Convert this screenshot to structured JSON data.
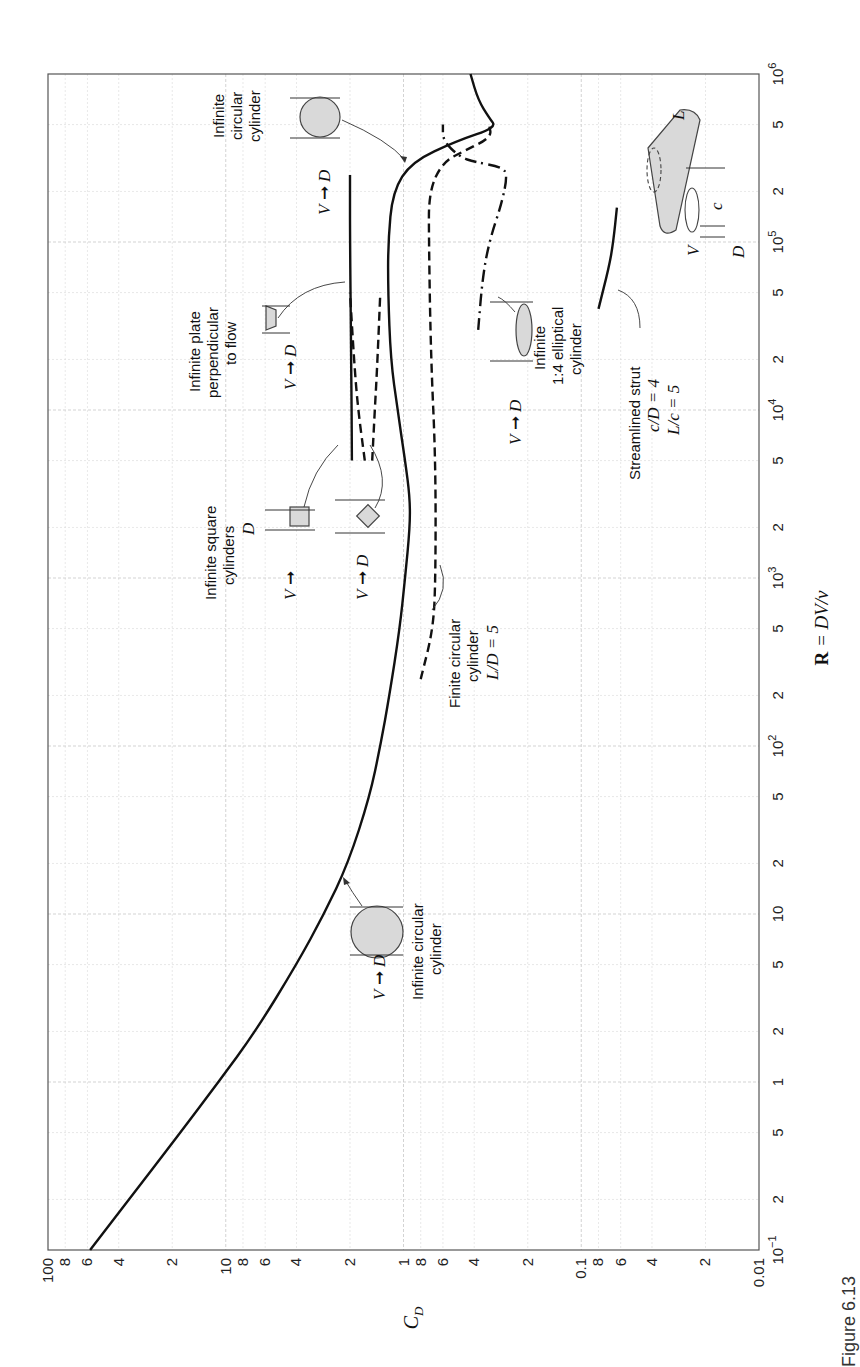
{
  "figure": {
    "caption_fragment": "Figure 6.13",
    "orientation": "rotated 90° counter-clockwise (Reynolds number runs bottom→top along the right edge; C_D runs left→right along the bottom edge)"
  },
  "axes": {
    "cd_label": "C",
    "cd_label_sub": "D",
    "re_label_bold": "R",
    "re_label_rest": " = DV/ν",
    "cd_ticks": [
      {
        "v": 100,
        "t": "100"
      },
      {
        "v": 80,
        "t": "8"
      },
      {
        "v": 60,
        "t": "6"
      },
      {
        "v": 40,
        "t": "4"
      },
      {
        "v": 20,
        "t": "2"
      },
      {
        "v": 10,
        "t": "10"
      },
      {
        "v": 8,
        "t": "8"
      },
      {
        "v": 6,
        "t": "6"
      },
      {
        "v": 4,
        "t": "4"
      },
      {
        "v": 2,
        "t": "2"
      },
      {
        "v": 1,
        "t": "1"
      },
      {
        "v": 0.8,
        "t": "8"
      },
      {
        "v": 0.6,
        "t": "6"
      },
      {
        "v": 0.4,
        "t": "4"
      },
      {
        "v": 0.2,
        "t": "2"
      },
      {
        "v": 0.1,
        "t": "0.1"
      },
      {
        "v": 0.08,
        "t": "8"
      },
      {
        "v": 0.06,
        "t": "6"
      },
      {
        "v": 0.04,
        "t": "4"
      },
      {
        "v": 0.02,
        "t": "2"
      },
      {
        "v": 0.01,
        "t": "0.01"
      }
    ],
    "re_ticks": [
      {
        "v": 0.1,
        "t": "10",
        "sup": "−1"
      },
      {
        "v": 0.2,
        "t": "2"
      },
      {
        "v": 0.5,
        "t": "5"
      },
      {
        "v": 1,
        "t": "1"
      },
      {
        "v": 2,
        "t": "2"
      },
      {
        "v": 5,
        "t": "5"
      },
      {
        "v": 10,
        "t": "10"
      },
      {
        "v": 20,
        "t": "2"
      },
      {
        "v": 50,
        "t": "5"
      },
      {
        "v": 100,
        "t": "10",
        "sup": "2"
      },
      {
        "v": 200,
        "t": "2"
      },
      {
        "v": 500,
        "t": "5"
      },
      {
        "v": 1000,
        "t": "10",
        "sup": "3"
      },
      {
        "v": 2000,
        "t": "2"
      },
      {
        "v": 5000,
        "t": "5"
      },
      {
        "v": 10000,
        "t": "10",
        "sup": "4"
      },
      {
        "v": 20000,
        "t": "2"
      },
      {
        "v": 50000,
        "t": "5"
      },
      {
        "v": 100000,
        "t": "10",
        "sup": "5"
      },
      {
        "v": 200000,
        "t": "2"
      },
      {
        "v": 500000,
        "t": "5"
      },
      {
        "v": 1000000,
        "t": "10",
        "sup": "6"
      }
    ]
  },
  "annotations": {
    "circ_low": {
      "line1": "Infinite circular",
      "line2": "cylinder"
    },
    "square": {
      "line1": "Infinite square",
      "line2": "cylinders",
      "dim": "D"
    },
    "plate": {
      "line1": "Infinite plate",
      "line2": "perpendicular",
      "line3": "to flow"
    },
    "circ_high": {
      "line1": "Infinite",
      "line2": "circular",
      "line3": "cylinder"
    },
    "finite": {
      "line1": "Finite circular",
      "line2": "cylinder",
      "line3": "L/D = 5"
    },
    "ellipse": {
      "line1": "Infinite",
      "line2": "1:4 elliptical",
      "line3": "cylinder"
    },
    "strut": {
      "line1": "Streamlined strut",
      "line2": "c/D = 4",
      "line3": "L/c = 5"
    },
    "V": "V",
    "D": "D",
    "L": "L",
    "c": "c"
  },
  "chart_data": {
    "type": "line",
    "xlabel": "R = DV/ν",
    "ylabel": "C_D",
    "xscale": "log",
    "yscale": "log",
    "xlim": [
      0.1,
      1000000
    ],
    "ylim": [
      0.01,
      100
    ],
    "grid": true,
    "legend_position": "inline annotations with leader arrows",
    "series": [
      {
        "name": "Infinite circular cylinder",
        "style": "solid",
        "points": [
          [
            0.1,
            58
          ],
          [
            0.2,
            35
          ],
          [
            0.5,
            18
          ],
          [
            1,
            11
          ],
          [
            2,
            6.8
          ],
          [
            5,
            4.0
          ],
          [
            10,
            2.8
          ],
          [
            20,
            2.05
          ],
          [
            50,
            1.55
          ],
          [
            100,
            1.35
          ],
          [
            200,
            1.2
          ],
          [
            500,
            1.05
          ],
          [
            1000,
            0.98
          ],
          [
            2000,
            0.92
          ],
          [
            3000,
            0.92
          ],
          [
            5000,
            0.98
          ],
          [
            10000,
            1.08
          ],
          [
            20000,
            1.18
          ],
          [
            50000,
            1.22
          ],
          [
            100000,
            1.22
          ],
          [
            200000,
            1.15
          ],
          [
            300000,
            0.9
          ],
          [
            400000,
            0.5
          ],
          [
            480000,
            0.3
          ],
          [
            550000,
            0.33
          ],
          [
            700000,
            0.38
          ],
          [
            1000000,
            0.42
          ]
        ]
      },
      {
        "name": "Infinite square cylinder (face normal to flow)",
        "style": "dashed",
        "points": [
          [
            5000,
            1.65
          ],
          [
            10000,
            1.8
          ],
          [
            20000,
            1.9
          ],
          [
            50000,
            2.0
          ]
        ]
      },
      {
        "name": "Infinite square cylinder (diagonal to flow)",
        "style": "dashed",
        "points": [
          [
            5000,
            1.5
          ],
          [
            10000,
            1.45
          ],
          [
            20000,
            1.4
          ],
          [
            50000,
            1.35
          ]
        ]
      },
      {
        "name": "Infinite plate perpendicular to flow",
        "style": "solid",
        "points": [
          [
            5000,
            1.95
          ],
          [
            20000,
            1.97
          ],
          [
            100000,
            2.0
          ],
          [
            250000,
            2.0
          ]
        ]
      },
      {
        "name": "Finite circular cylinder L/D = 5",
        "style": "dashed",
        "points": [
          [
            250,
            0.8
          ],
          [
            500,
            0.68
          ],
          [
            1000,
            0.66
          ],
          [
            5000,
            0.66
          ],
          [
            20000,
            0.7
          ],
          [
            100000,
            0.72
          ],
          [
            200000,
            0.72
          ],
          [
            300000,
            0.6
          ],
          [
            350000,
            0.45
          ],
          [
            420000,
            0.32
          ],
          [
            500000,
            0.33
          ]
        ]
      },
      {
        "name": "Infinite 1:4 elliptical cylinder",
        "style": "dash-dot",
        "points": [
          [
            30000,
            0.38
          ],
          [
            60000,
            0.36
          ],
          [
            100000,
            0.33
          ],
          [
            170000,
            0.28
          ],
          [
            250000,
            0.26
          ],
          [
            280000,
            0.28
          ],
          [
            300000,
            0.4
          ],
          [
            320000,
            0.48
          ],
          [
            400000,
            0.6
          ],
          [
            500000,
            0.6
          ]
        ]
      },
      {
        "name": "Streamlined strut c/D = 4, L/c = 5",
        "style": "solid",
        "points": [
          [
            40000,
            0.08
          ],
          [
            70000,
            0.07
          ],
          [
            100000,
            0.066
          ],
          [
            160000,
            0.063
          ]
        ]
      }
    ]
  }
}
